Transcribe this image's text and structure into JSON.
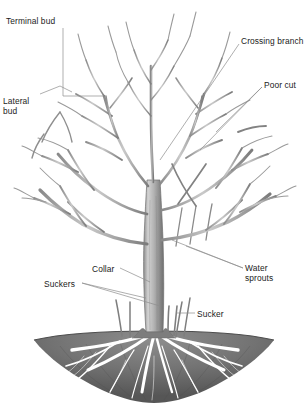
{
  "diagram": {
    "background_color": "#ffffff",
    "ink_color": "#4a4a4a",
    "text_color": "#1b1b1b",
    "leader_color": "#8d8d8d",
    "soil_color": "#6f6f6f",
    "root_color": "#ffffff",
    "soil_line_y": 337
  },
  "labels": [
    {
      "id": "terminal-bud",
      "text": "Terminal bud",
      "lines": [
        "Terminal bud"
      ],
      "x": 6,
      "y": 16,
      "align": "left"
    },
    {
      "id": "lateral-bud",
      "text": "Lateral bud",
      "lines": [
        "Lateral",
        "bud"
      ],
      "x": 3,
      "y": 96,
      "align": "left"
    },
    {
      "id": "crossing-branch",
      "text": "Crossing branch",
      "lines": [
        "Crossing branch"
      ],
      "x": 241,
      "y": 36,
      "align": "left"
    },
    {
      "id": "poor-cut",
      "text": "Poor cut",
      "lines": [
        "Poor cut"
      ],
      "x": 264,
      "y": 80,
      "align": "left"
    },
    {
      "id": "water-sprouts",
      "text": "Water sprouts",
      "lines": [
        "Water",
        "sprouts"
      ],
      "x": 245,
      "y": 263,
      "align": "left"
    },
    {
      "id": "sucker",
      "text": "Sucker",
      "lines": [
        "Sucker"
      ],
      "x": 197,
      "y": 309,
      "align": "left"
    },
    {
      "id": "collar",
      "text": "Collar",
      "lines": [
        "Collar"
      ],
      "x": 92,
      "y": 264,
      "align": "left"
    },
    {
      "id": "suckers",
      "text": "Suckers",
      "lines": [
        "Suckers"
      ],
      "x": 44,
      "y": 279,
      "align": "left"
    }
  ],
  "parts": [
    {
      "id": "canopy",
      "name": "branch canopy"
    },
    {
      "id": "trunk",
      "name": "trunk"
    },
    {
      "id": "roots",
      "name": "root system"
    },
    {
      "id": "soil",
      "name": "soil mound"
    }
  ]
}
